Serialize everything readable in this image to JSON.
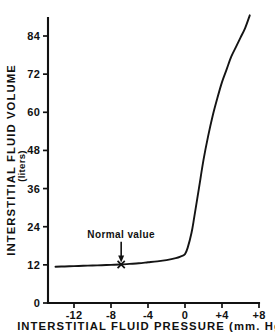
{
  "chart_data": {
    "type": "line",
    "title": "",
    "xlabel": "INTERSTITIAL  FLUID  PRESSURE   (mm. Hg)",
    "ylabel": "INTERSTITIAL   FLUID   VOLUME",
    "ylabel_units": "(liters)",
    "xlim": [
      -14,
      8
    ],
    "ylim": [
      0,
      92
    ],
    "grid": false,
    "legend": null,
    "x_ticks": [
      -12,
      -8,
      -4,
      0,
      4,
      8
    ],
    "x_tick_labels": [
      "-12",
      "-8",
      "-4",
      "0",
      "+4",
      "+8"
    ],
    "y_ticks": [
      0,
      12,
      24,
      36,
      48,
      60,
      72,
      84
    ],
    "y_tick_labels": [
      "0",
      "12",
      "24",
      "36",
      "48",
      "60",
      "72",
      "84"
    ],
    "series": [
      {
        "name": "interstitial fluid volume",
        "x": [
          -14,
          -13,
          -12,
          -11,
          -10,
          -9,
          -8,
          -7,
          -6,
          -5,
          -4,
          -3,
          -2,
          -1,
          -0.5,
          0,
          0.3,
          0.7,
          1,
          1.5,
          2,
          2.5,
          3,
          3.5,
          4,
          4.5,
          5,
          5.5,
          6,
          6.5,
          7
        ],
        "y": [
          11.4,
          11.5,
          11.6,
          11.7,
          11.8,
          11.9,
          12.0,
          12.1,
          12.3,
          12.5,
          12.8,
          13.1,
          13.5,
          14.1,
          14.6,
          15.4,
          17.5,
          22.0,
          27.0,
          36.0,
          45.0,
          52.5,
          59.0,
          64.5,
          69.5,
          73.5,
          77.5,
          80.5,
          83.5,
          86.5,
          90.5
        ]
      }
    ],
    "annotations": [
      {
        "id": "normal-value",
        "text": "Normal  value",
        "marker": "x",
        "x": -6.9,
        "y": 12.1,
        "label_x": -6.9,
        "label_y": 20.5
      }
    ],
    "colors": {
      "curve": "#141414",
      "axis": "#111111",
      "background": "#ffffff",
      "text": "#111111"
    }
  }
}
